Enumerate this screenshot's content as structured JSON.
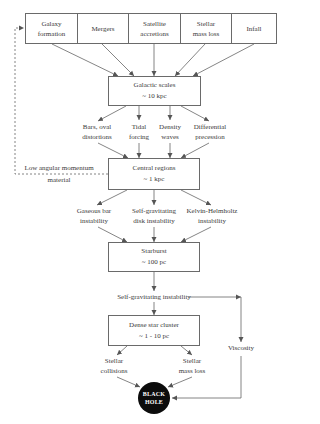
{
  "diagram": {
    "top_row": [
      {
        "line1": "Galaxy",
        "line2": "formation"
      },
      {
        "line1": "Mergers",
        "line2": ""
      },
      {
        "line1": "Satellite",
        "line2": "accretions"
      },
      {
        "line1": "Stellar",
        "line2": "mass loss"
      },
      {
        "line1": "Infall",
        "line2": ""
      }
    ],
    "galactic": {
      "title": "Galactic scales",
      "scale": "~ 10 kpc"
    },
    "galactic_mechanisms": [
      {
        "line1": "Bars, oval",
        "line2": "distortions"
      },
      {
        "line1": "Tidal",
        "line2": "forcing"
      },
      {
        "line1": "Density",
        "line2": "waves"
      },
      {
        "line1": "Differential",
        "line2": "precession"
      }
    ],
    "feedback": {
      "line1": "Low angular momentum",
      "line2": "material"
    },
    "central": {
      "title": "Central regions",
      "scale": "~ 1 kpc"
    },
    "central_mechanisms": [
      {
        "line1": "Gaseous bar",
        "line2": "instability"
      },
      {
        "line1": "Self-gravitating",
        "line2": "disk instability"
      },
      {
        "line1": "Kelvin-Helmholtz",
        "line2": "instability"
      }
    ],
    "starburst": {
      "title": "Starburst",
      "scale": "~ 100 pc"
    },
    "sg_instability": "Self-gravitating instability",
    "cluster": {
      "title": "Dense star cluster",
      "scale": "~ 1 - 10 pc"
    },
    "viscosity": "Viscosity",
    "cluster_mechanisms": [
      {
        "line1": "Stellar",
        "line2": "collisions"
      },
      {
        "line1": "Stellar",
        "line2": "mass loss"
      }
    ],
    "black_hole": {
      "line1": "BLACK",
      "line2": "HOLE"
    }
  }
}
